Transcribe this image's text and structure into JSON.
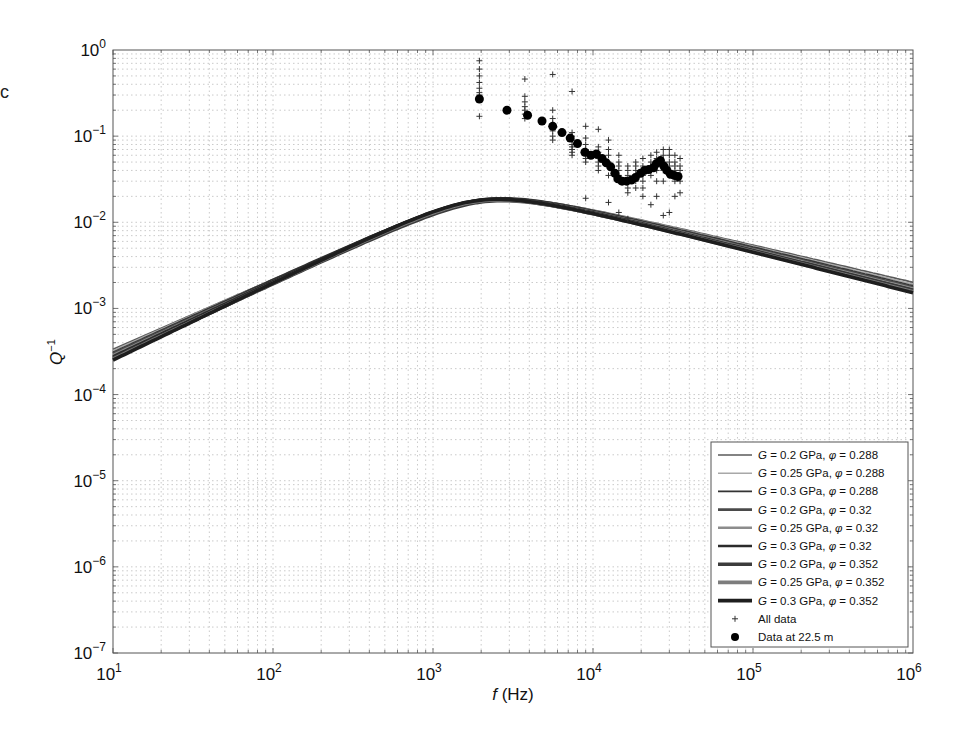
{
  "panel_label": "c",
  "chart_data": {
    "type": "line",
    "title": "",
    "xlabel": "f (Hz)",
    "ylabel": "Q^-1",
    "xscale": "log",
    "yscale": "log",
    "xlim": [
      10,
      1000000
    ],
    "ylim": [
      1e-07,
      1
    ],
    "grid": true,
    "legend_position": "lower right",
    "x_ticks": [
      {
        "value": 10,
        "base": "10",
        "exp": "1"
      },
      {
        "value": 100,
        "base": "10",
        "exp": "2"
      },
      {
        "value": 1000,
        "base": "10",
        "exp": "3"
      },
      {
        "value": 10000,
        "base": "10",
        "exp": "4"
      },
      {
        "value": 100000,
        "base": "10",
        "exp": "5"
      },
      {
        "value": 1000000,
        "base": "10",
        "exp": "6"
      }
    ],
    "y_ticks": [
      {
        "value": 1,
        "base": "10",
        "exp": "0"
      },
      {
        "value": 0.1,
        "base": "10",
        "exp": "−1"
      },
      {
        "value": 0.01,
        "base": "10",
        "exp": "−2"
      },
      {
        "value": 0.001,
        "base": "10",
        "exp": "−3"
      },
      {
        "value": 0.0001,
        "base": "10",
        "exp": "−4"
      },
      {
        "value": 1e-05,
        "base": "10",
        "exp": "−5"
      },
      {
        "value": 1e-06,
        "base": "10",
        "exp": "−6"
      },
      {
        "value": 1e-07,
        "base": "10",
        "exp": "−7"
      }
    ],
    "series": [
      {
        "name": "G = 0.2 GPa, φ = 0.288",
        "G": "0.2",
        "phi": "0.288",
        "color": "#5a5a5a",
        "width": 1.6,
        "peak_f": 2300,
        "peak_q": 0.0182,
        "q_at_10Hz": 0.00021,
        "q_at_1e6Hz": 0.00125
      },
      {
        "name": "G = 0.25 GPa, φ = 0.288",
        "G": "0.25",
        "phi": "0.288",
        "color": "#a8a8a8",
        "width": 1.6,
        "peak_f": 2200,
        "peak_q": 0.0185,
        "q_at_10Hz": 0.0002,
        "q_at_1e6Hz": 0.00118
      },
      {
        "name": "G = 0.3 GPa, φ = 0.288",
        "G": "0.3",
        "phi": "0.288",
        "color": "#333333",
        "width": 1.6,
        "peak_f": 2100,
        "peak_q": 0.0188,
        "q_at_10Hz": 0.00019,
        "q_at_1e6Hz": 0.00112
      },
      {
        "name": "G = 0.2 GPa, φ = 0.32",
        "G": "0.2",
        "phi": "0.32",
        "color": "#4a4a4a",
        "width": 2.6,
        "peak_f": 2200,
        "peak_q": 0.0178,
        "q_at_10Hz": 0.000185,
        "q_at_1e6Hz": 0.00108
      },
      {
        "name": "G = 0.25 GPa, φ = 0.32",
        "G": "0.25",
        "phi": "0.32",
        "color": "#8c8c8c",
        "width": 2.6,
        "peak_f": 2100,
        "peak_q": 0.018,
        "q_at_10Hz": 0.000175,
        "q_at_1e6Hz": 0.00103
      },
      {
        "name": "G = 0.3 GPa, φ = 0.32",
        "G": "0.3",
        "phi": "0.32",
        "color": "#2b2b2b",
        "width": 2.6,
        "peak_f": 2000,
        "peak_q": 0.0183,
        "q_at_10Hz": 0.000168,
        "q_at_1e6Hz": 0.00099
      },
      {
        "name": "G = 0.2 GPa, φ = 0.352",
        "G": "0.2",
        "phi": "0.352",
        "color": "#3c3c3c",
        "width": 3.6,
        "peak_f": 2100,
        "peak_q": 0.0174,
        "q_at_10Hz": 0.00016,
        "q_at_1e6Hz": 0.00097
      },
      {
        "name": "G = 0.25 GPa, φ = 0.352",
        "G": "0.25",
        "phi": "0.352",
        "color": "#7d7d7d",
        "width": 3.6,
        "peak_f": 2000,
        "peak_q": 0.0177,
        "q_at_10Hz": 0.000155,
        "q_at_1e6Hz": 0.00093
      },
      {
        "name": "G = 0.3 GPa, φ = 0.352",
        "G": "0.3",
        "phi": "0.352",
        "color": "#1e1e1e",
        "width": 3.6,
        "peak_f": 1950,
        "peak_q": 0.018,
        "q_at_10Hz": 0.00015,
        "q_at_1e6Hz": 0.0009
      }
    ],
    "scatter_series": [
      {
        "name": "All data",
        "marker": "+",
        "color": "#333333",
        "x": [
          1950,
          1950,
          1950,
          1950,
          1950,
          1950,
          1950,
          1950,
          1950,
          3750,
          3750,
          3750,
          3750,
          3750,
          3750,
          3750,
          5600,
          5600,
          5600,
          5600,
          5600,
          5600,
          5600,
          5600,
          7400,
          7400,
          7400,
          7400,
          7400,
          7400,
          7400,
          7400,
          7400,
          9000,
          9000,
          9000,
          9000,
          9000,
          9000,
          9000,
          9000,
          9000,
          10800,
          10800,
          10800,
          10800,
          10800,
          10800,
          10800,
          10800,
          12500,
          12500,
          12500,
          12500,
          12500,
          12500,
          12500,
          14500,
          14500,
          14500,
          14500,
          14500,
          14500,
          14500,
          16500,
          16500,
          16500,
          16500,
          16500,
          16500,
          16500,
          18500,
          18500,
          18500,
          18500,
          18500,
          18500,
          20500,
          20500,
          20500,
          20500,
          20500,
          20500,
          20500,
          23000,
          23000,
          23000,
          23000,
          23000,
          23000,
          25000,
          25000,
          25000,
          25000,
          25000,
          25000,
          25000,
          27500,
          27500,
          27500,
          27500,
          27500,
          27500,
          27500,
          30000,
          30000,
          30000,
          30000,
          30000,
          30000,
          32500,
          32500,
          32500,
          32500,
          32500,
          32500,
          35000,
          35000,
          35000,
          35000,
          35000
        ],
        "y": [
          0.75,
          0.6,
          0.5,
          0.42,
          0.36,
          0.32,
          0.3,
          0.28,
          0.17,
          0.46,
          0.29,
          0.25,
          0.22,
          0.2,
          0.18,
          0.16,
          0.52,
          0.2,
          0.16,
          0.14,
          0.13,
          0.115,
          0.1,
          0.09,
          0.33,
          0.11,
          0.1,
          0.09,
          0.08,
          0.075,
          0.07,
          0.065,
          0.06,
          0.13,
          0.095,
          0.08,
          0.07,
          0.065,
          0.06,
          0.055,
          0.05,
          0.019,
          0.12,
          0.075,
          0.065,
          0.06,
          0.055,
          0.05,
          0.045,
          0.04,
          0.09,
          0.07,
          0.06,
          0.05,
          0.045,
          0.035,
          0.017,
          0.06,
          0.05,
          0.045,
          0.04,
          0.035,
          0.03,
          0.013,
          0.045,
          0.04,
          0.035,
          0.03,
          0.025,
          0.022,
          0.011,
          0.05,
          0.045,
          0.04,
          0.035,
          0.03,
          0.025,
          0.055,
          0.045,
          0.04,
          0.035,
          0.03,
          0.025,
          0.02,
          0.06,
          0.05,
          0.045,
          0.04,
          0.035,
          0.016,
          0.065,
          0.055,
          0.05,
          0.045,
          0.04,
          0.03,
          0.02,
          0.07,
          0.06,
          0.05,
          0.045,
          0.04,
          0.03,
          0.012,
          0.07,
          0.06,
          0.05,
          0.045,
          0.035,
          0.013,
          0.06,
          0.05,
          0.045,
          0.04,
          0.03,
          0.02,
          0.055,
          0.045,
          0.04,
          0.03,
          0.022
        ]
      },
      {
        "name": "Data at 22.5 m",
        "marker": "o",
        "color": "#000000",
        "x": [
          1950,
          2900,
          3900,
          4800,
          5600,
          6400,
          7200,
          8000,
          8900,
          9700,
          10500,
          11400,
          12100,
          12900,
          13700,
          14300,
          15200,
          16200,
          17400,
          18400,
          19800,
          21000,
          22300,
          23900,
          24900,
          26400,
          27700,
          29000,
          30500,
          32200,
          34000
        ],
        "y": [
          0.27,
          0.2,
          0.175,
          0.15,
          0.13,
          0.11,
          0.095,
          0.082,
          0.065,
          0.06,
          0.062,
          0.055,
          0.049,
          0.044,
          0.037,
          0.032,
          0.03,
          0.03,
          0.031,
          0.033,
          0.037,
          0.04,
          0.041,
          0.043,
          0.048,
          0.052,
          0.045,
          0.04,
          0.036,
          0.035,
          0.034
        ]
      }
    ]
  },
  "legend": {
    "items": [
      {
        "g_sym": "G",
        "text1": " = 0.2 GPa, ",
        "phi_sym": "φ",
        "text2": " = 0.288"
      },
      {
        "g_sym": "G",
        "text1": " = 0.25 GPa, ",
        "phi_sym": "φ",
        "text2": " = 0.288"
      },
      {
        "g_sym": "G",
        "text1": " = 0.3 GPa, ",
        "phi_sym": "φ",
        "text2": " = 0.288"
      },
      {
        "g_sym": "G",
        "text1": " = 0.2 GPa, ",
        "phi_sym": "φ",
        "text2": " = 0.32"
      },
      {
        "g_sym": "G",
        "text1": " = 0.25 GPa, ",
        "phi_sym": "φ",
        "text2": " = 0.32"
      },
      {
        "g_sym": "G",
        "text1": " = 0.3 GPa, ",
        "phi_sym": "φ",
        "text2": " = 0.32"
      },
      {
        "g_sym": "G",
        "text1": " = 0.2 GPa, ",
        "phi_sym": "φ",
        "text2": " = 0.352"
      },
      {
        "g_sym": "G",
        "text1": " = 0.25 GPa, ",
        "phi_sym": "φ",
        "text2": " = 0.352"
      },
      {
        "g_sym": "G",
        "text1": " = 0.3 GPa, ",
        "phi_sym": "φ",
        "text2": " = 0.352"
      }
    ],
    "all_data": "All data",
    "depth_data": "Data at 22.5 m"
  },
  "axes": {
    "x_label_f": "f",
    "x_label_unit": " (Hz)",
    "y_label_q": "Q",
    "y_label_exp": "−1"
  }
}
